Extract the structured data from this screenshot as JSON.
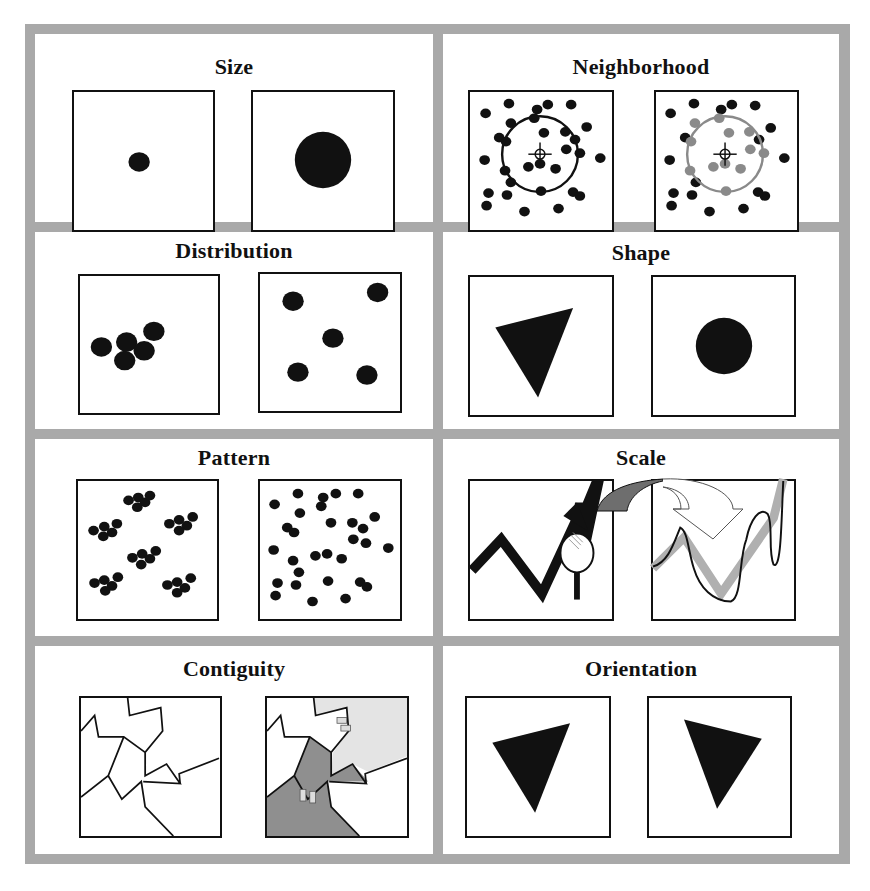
{
  "figure": {
    "colors": {
      "frame": "#a9a9a9",
      "ink": "#111111",
      "gray_dot": "#8a8a8a",
      "dark_region": "#8f8f8f",
      "light_region": "#e4e4e4",
      "arrow_fill": "#6e6e6e",
      "gray_line": "#b0b0b0"
    },
    "panels": [
      {
        "id": "size",
        "title": "Size",
        "left": "small dot",
        "right": "large dot"
      },
      {
        "id": "neighborhood",
        "title": "Neighborhood",
        "left": "points with circular neighborhood around crosshair",
        "right": "points inside neighborhood highlighted gray"
      },
      {
        "id": "distribution",
        "title": "Distribution",
        "left": "clustered 5 dots",
        "right": "dispersed 5 dots"
      },
      {
        "id": "shape",
        "title": "Shape",
        "left": "triangle",
        "right": "circle"
      },
      {
        "id": "pattern",
        "title": "Pattern",
        "left": "clustered groups",
        "right": "random points"
      },
      {
        "id": "scale",
        "title": "Scale",
        "left": "coarse zigzag with magnifier",
        "right": "detailed line at finer scale"
      },
      {
        "id": "contiguity",
        "title": "Contiguity",
        "left": "polygon boundaries",
        "right": "adjacent regions shaded"
      },
      {
        "id": "orientation",
        "title": "Orientation",
        "left": "triangle rotated",
        "right": "triangle rotated differently"
      }
    ]
  }
}
